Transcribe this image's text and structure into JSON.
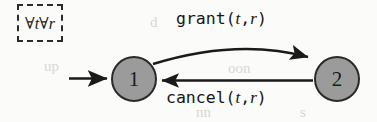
{
  "diagram": {
    "type": "state-transition-diagram",
    "quantifier": {
      "text": "∀t∀r",
      "forall_1": "∀",
      "var_1": "t",
      "forall_2": "∀",
      "var_2": "r"
    },
    "states": [
      {
        "id": "1",
        "label": "1",
        "initial": true,
        "fill": "#9b9b9b",
        "stroke": "#2a2a2a"
      },
      {
        "id": "2",
        "label": "2",
        "initial": false,
        "fill": "#9b9b9b",
        "stroke": "#2a2a2a"
      }
    ],
    "transitions": [
      {
        "id": "grant",
        "from": "1",
        "to": "2",
        "name": "grant",
        "open_paren": "(",
        "arg_1": "t",
        "comma": ",",
        "arg_2": "r",
        "close_paren": ")",
        "label": "grant(t, r)",
        "shape": "curved"
      },
      {
        "id": "cancel",
        "from": "2",
        "to": "1",
        "name": "cancel",
        "open_paren": "(",
        "arg_1": "t",
        "comma": ",",
        "arg_2": "r",
        "close_paren": ")",
        "label": "cancel(t, r)",
        "shape": "straight"
      }
    ],
    "colors": {
      "ink": "#1a1a1a",
      "node_fill": "#9b9b9b",
      "background": "#fbfbf9"
    },
    "artifacts": [
      {
        "text": "d",
        "left": 150,
        "top": 14
      },
      {
        "text": "up",
        "left": 44,
        "top": 58
      },
      {
        "text": "oon",
        "left": 228,
        "top": 60
      },
      {
        "text": "nn",
        "left": 196,
        "top": 104
      },
      {
        "text": "s",
        "left": 300,
        "top": 104
      }
    ]
  }
}
